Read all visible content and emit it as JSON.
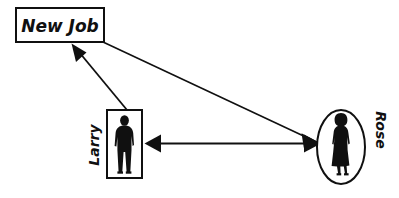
{
  "diagram": {
    "background_color": "#ffffff",
    "stroke_color": "#101010",
    "fill_color": "#101010",
    "nodes": [
      {
        "id": "new-job",
        "label": "New Job",
        "shape": "rectangle",
        "label_orientation": "horizontal",
        "x": 16,
        "y": 8,
        "width": 88,
        "height": 34
      },
      {
        "id": "larry",
        "label": "Larry",
        "shape": "rectangle",
        "figure": "man-silhouette",
        "label_orientation": "rotated-ccw",
        "x": 107,
        "y": 110,
        "width": 35,
        "height": 68
      },
      {
        "id": "rose",
        "label": "Rose",
        "shape": "ellipse",
        "figure": "woman-silhouette",
        "label_orientation": "rotated-cw",
        "cx": 341,
        "cy": 147,
        "rx": 24,
        "ry": 37
      }
    ],
    "edges": [
      {
        "id": "larry-to-new-job",
        "from": "larry",
        "to": "new-job",
        "arrowheads": "end",
        "x1": 127,
        "y1": 110,
        "x2": 72,
        "y2": 44
      },
      {
        "id": "new-job-to-rose",
        "from": "new-job",
        "to": "rose",
        "arrowheads": "end",
        "x1": 103,
        "y1": 42,
        "x2": 320,
        "y2": 143
      },
      {
        "id": "larry-rose-bidirectional",
        "from": "larry",
        "to": "rose",
        "arrowheads": "both",
        "x1": 145,
        "y1": 143,
        "x2": 320,
        "y2": 143
      }
    ]
  }
}
